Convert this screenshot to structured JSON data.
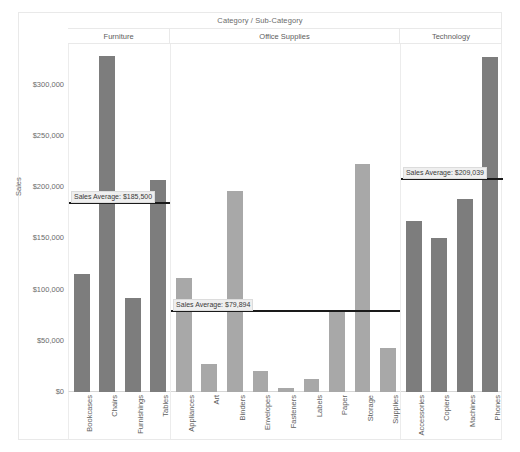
{
  "header": {
    "title": "Category  /  Sub-Category"
  },
  "axis": {
    "y_title": "Sales",
    "y_ticks": [
      "$300,000",
      "$250,000",
      "$200,000",
      "$150,000",
      "$100,000",
      "$50,000",
      "$0"
    ]
  },
  "chart_data": {
    "type": "bar",
    "title": "Category  /  Sub-Category",
    "xlabel": "",
    "ylabel": "Sales",
    "ylim": [
      0,
      340000
    ],
    "grid": false,
    "legend": null,
    "y_tick_values": [
      300000,
      250000,
      200000,
      150000,
      100000,
      50000,
      0
    ],
    "y_tick_labels": [
      "$300,000",
      "$250,000",
      "$200,000",
      "$150,000",
      "$100,000",
      "$50,000",
      "$0"
    ],
    "panels": [
      {
        "category": "Furniture",
        "color": "#7d7d7d",
        "reference_line": {
          "label": "Sales Average: $185,500",
          "value": 185500
        },
        "categories": [
          "Bookcases",
          "Chairs",
          "Furnishings",
          "Tables"
        ],
        "values": [
          115000,
          328000,
          92000,
          207000
        ]
      },
      {
        "category": "Office Supplies",
        "color": "#a8a8a8",
        "reference_line": {
          "label": "Sales Average: $79,894",
          "value": 79894
        },
        "categories": [
          "Appliances",
          "Art",
          "Binders",
          "Envelopes",
          "Fasteners",
          "Labels",
          "Paper",
          "Storage",
          "Supplies"
        ],
        "values": [
          111000,
          27000,
          196000,
          21000,
          3500,
          12500,
          78000,
          223000,
          43000
        ]
      },
      {
        "category": "Technology",
        "color": "#7d7d7d",
        "reference_line": {
          "label": "Sales Average: $209,039",
          "value": 209039
        },
        "categories": [
          "Accessories",
          "Copiers",
          "Machines",
          "Phones"
        ],
        "values": [
          167000,
          150000,
          189000,
          327000
        ]
      }
    ]
  }
}
